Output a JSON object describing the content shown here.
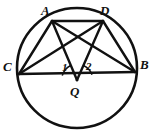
{
  "figure": {
    "kind": "geometry-diagram",
    "background_color": "#ffffff",
    "stroke_color": "#111111",
    "label_color": "#111111",
    "circle": {
      "cx": 77,
      "cy": 68,
      "r": 60,
      "stroke_width": 2.6
    },
    "points": [
      {
        "id": "A",
        "label": "A",
        "x": 52,
        "y": 21,
        "label_x": 41,
        "label_y": 4
      },
      {
        "id": "D",
        "label": "D",
        "x": 103,
        "y": 21,
        "label_x": 100,
        "label_y": 4
      },
      {
        "id": "C",
        "label": "C",
        "x": 19,
        "y": 74,
        "label_x": 3,
        "label_y": 60
      },
      {
        "id": "B",
        "label": "B",
        "x": 135,
        "y": 72,
        "label_x": 140,
        "label_y": 58
      },
      {
        "id": "Q",
        "label": "Q",
        "x": 77,
        "y": 80,
        "label_x": 70,
        "label_y": 85
      }
    ],
    "segments": [
      {
        "from": "C",
        "to": "A"
      },
      {
        "from": "C",
        "to": "D"
      },
      {
        "from": "C",
        "to": "B"
      },
      {
        "from": "A",
        "to": "D"
      },
      {
        "from": "A",
        "to": "Q"
      },
      {
        "from": "A",
        "to": "B"
      },
      {
        "from": "D",
        "to": "Q"
      },
      {
        "from": "D",
        "to": "B"
      }
    ],
    "angle_marks": [
      {
        "id": "angle-1",
        "label": "1",
        "at": "Q",
        "label_x": 62,
        "label_y": 62,
        "arc_radius": 15
      },
      {
        "id": "angle-2",
        "label": "2",
        "at": "Q",
        "label_x": 86,
        "label_y": 61,
        "arc_radius": 15
      }
    ]
  }
}
